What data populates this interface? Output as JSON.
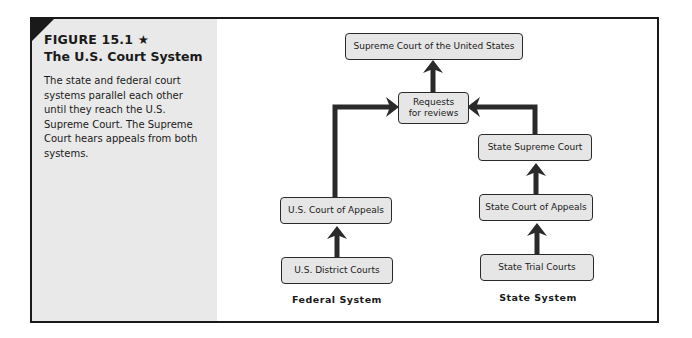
{
  "figure": {
    "label": "FIGURE 15.1 ★",
    "title": "The U.S. Court System",
    "caption": "The state and federal court systems parallel each other until they reach the U.S. Supreme Court. The Supreme Court hears appeals from both systems."
  },
  "diagram": {
    "nodes": {
      "supreme_court": "Supreme Court of the United States",
      "requests": "Requests for reviews",
      "us_court_of_appeals": "U.S. Court of Appeals",
      "us_district_courts": "U.S. District Courts",
      "state_supreme_court": "State Supreme Court",
      "state_court_of_appeals": "State Court of Appeals",
      "state_trial_courts": "State Trial Courts"
    },
    "labels": {
      "federal": "Federal System",
      "state": "State System"
    },
    "edges": [
      {
        "from": "us_district_courts",
        "to": "us_court_of_appeals"
      },
      {
        "from": "us_court_of_appeals",
        "to": "requests"
      },
      {
        "from": "state_trial_courts",
        "to": "state_court_of_appeals"
      },
      {
        "from": "state_court_of_appeals",
        "to": "state_supreme_court"
      },
      {
        "from": "state_supreme_court",
        "to": "requests"
      },
      {
        "from": "requests",
        "to": "supreme_court"
      }
    ]
  }
}
